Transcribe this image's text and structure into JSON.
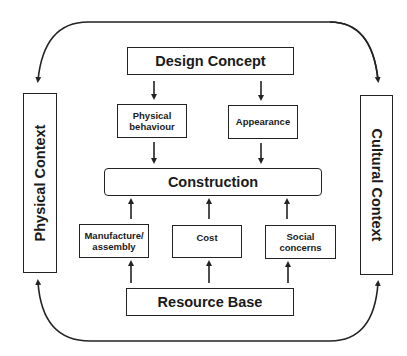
{
  "diagram": {
    "type": "flow-diagram",
    "nodes": {
      "design_concept": "Design Concept",
      "physical_behaviour": [
        "Physical",
        "behaviour"
      ],
      "appearance": "Appearance",
      "construction": "Construction",
      "manufacture_assembly": [
        "Manufacture/",
        "assembly"
      ],
      "cost": "Cost",
      "social_concerns": [
        "Social",
        "concerns"
      ],
      "resource_base": "Resource Base",
      "physical_context": "Physical Context",
      "cultural_context": "Cultural Context"
    },
    "edges": [
      {
        "from": "Design Concept",
        "to": "Physical behaviour"
      },
      {
        "from": "Design Concept",
        "to": "Appearance"
      },
      {
        "from": "Physical behaviour",
        "to": "Construction"
      },
      {
        "from": "Appearance",
        "to": "Construction"
      },
      {
        "from": "Manufacture/assembly",
        "to": "Construction"
      },
      {
        "from": "Cost",
        "to": "Construction"
      },
      {
        "from": "Social concerns",
        "to": "Construction"
      },
      {
        "from": "Resource Base",
        "to": "Manufacture/assembly"
      },
      {
        "from": "Resource Base",
        "to": "Cost"
      },
      {
        "from": "Resource Base",
        "to": "Social concerns"
      },
      {
        "from": "top-loop",
        "to": "Physical Context"
      },
      {
        "from": "top-loop",
        "to": "Cultural Context"
      },
      {
        "from": "bottom-loop",
        "to": "Physical Context"
      },
      {
        "from": "bottom-loop",
        "to": "Cultural Context"
      }
    ],
    "colors": {
      "stroke": "#222222",
      "background": "#ffffff",
      "text": "#1a1a1a"
    }
  }
}
